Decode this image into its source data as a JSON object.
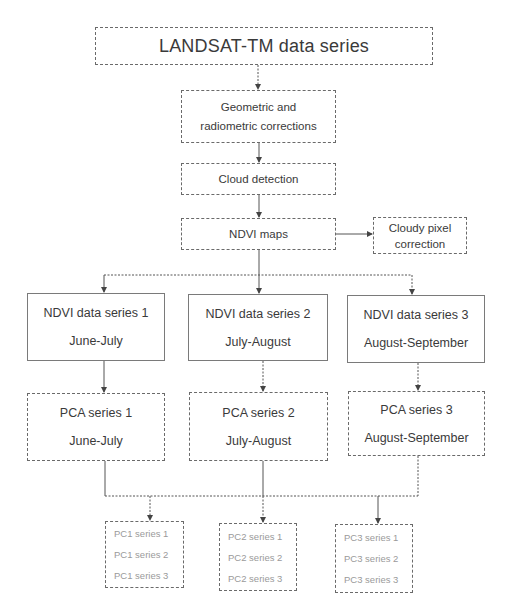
{
  "diagram": {
    "top": {
      "label": "LANDSAT-TM data series"
    },
    "steps": [
      {
        "id": "corrections",
        "lines": [
          "Geometric and",
          "radiometric corrections"
        ]
      },
      {
        "id": "cloud-detection",
        "lines": [
          "Cloud detection"
        ]
      },
      {
        "id": "ndvi-maps",
        "lines": [
          "NDVI maps"
        ]
      }
    ],
    "side": {
      "id": "cloudy-pixel-correction",
      "lines": [
        "Cloudy pixel",
        "correction"
      ]
    },
    "ndvi_series": [
      {
        "title": "NDVI data series 1",
        "period": "June-July"
      },
      {
        "title": "NDVI data series 2",
        "period": "July-August"
      },
      {
        "title": "NDVI data series 3",
        "period": "August-September"
      }
    ],
    "pca_series": [
      {
        "title": "PCA series 1",
        "period": "June-July"
      },
      {
        "title": "PCA series 2",
        "period": "July-August"
      },
      {
        "title": "PCA series 3",
        "period": "August-September"
      }
    ],
    "pc_outputs": [
      {
        "items": [
          "PC1 series 1",
          "PC1 series 2",
          "PC1 series 3"
        ]
      },
      {
        "items": [
          "PC2 series 1",
          "PC2 series 2",
          "PC2 series 3"
        ]
      },
      {
        "items": [
          "PC3 series 1",
          "PC3 series 2",
          "PC3 series 3"
        ]
      }
    ],
    "colors": {
      "line": "#555555",
      "text": "#3a3a3a",
      "muted_text": "#9a9a9a",
      "border": "#6a6a6a"
    }
  }
}
